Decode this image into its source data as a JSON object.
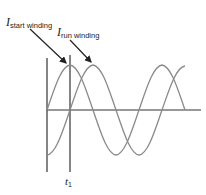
{
  "diagram": {
    "labels": {
      "start_main": "I",
      "start_sub": "start winding",
      "run_main": "I",
      "run_sub": "run winding",
      "t1_main": "t",
      "t1_sub": "1"
    },
    "series": [
      {
        "name": "I start winding",
        "phase_lead_deg": 90,
        "color": "#8a8a8a"
      },
      {
        "name": "I run winding",
        "phase_lead_deg": 0,
        "color": "#8a8a8a"
      }
    ],
    "colors": {
      "axis": "#333333",
      "curve": "#8a8a8a",
      "text": "#222222"
    }
  }
}
